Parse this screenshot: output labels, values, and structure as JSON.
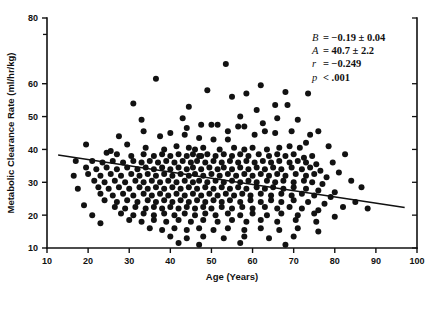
{
  "chart_data": {
    "type": "scatter",
    "title": "",
    "xlabel": "Age (Years)",
    "ylabel": "Metabolic Clearance Rate (ml/hr/kg)",
    "xlim": [
      10,
      100
    ],
    "ylim": [
      10,
      80
    ],
    "grid": false,
    "legend": null,
    "xticks": [
      10,
      20,
      30,
      40,
      50,
      60,
      70,
      80,
      90,
      100
    ],
    "xtick_labels": [
      "10",
      "20",
      "30",
      "40",
      "50",
      "60",
      "70",
      "80",
      "90",
      "100"
    ],
    "yticks": [
      10,
      20,
      30,
      40,
      50,
      60,
      80
    ],
    "ytick_labels": [
      "10",
      "20",
      "30",
      "40",
      "50",
      "60",
      "80"
    ],
    "yminor_ticks": [
      75
    ],
    "marker": "filled-circle",
    "marker_color": "#121212",
    "marker_size_px": 3.0,
    "annotations": [
      {
        "symbol": "B",
        "relation": "=",
        "value": "−0.19 ± 0.04"
      },
      {
        "symbol": "A",
        "relation": "=",
        "value": "40.7 ± 2.2"
      },
      {
        "symbol": "r",
        "relation": "=",
        "value": "−0.249"
      },
      {
        "symbol": "p",
        "relation": "<",
        "value": ".001"
      }
    ],
    "annotation_lines": [
      "B = −0.19 ± 0.04",
      "A = 40.7 ± 2.2",
      "r = −0.249",
      "p < .001"
    ],
    "regression": {
      "slope": -0.19,
      "intercept": 40.7,
      "r": -0.249,
      "p_text": "< .001",
      "x_start": 12.7,
      "y_start": 38.3,
      "x_end": 97.0,
      "y_end": 22.3,
      "color": "#111111"
    },
    "points": [
      [
        31.0,
        54.0
      ],
      [
        36.5,
        61.5
      ],
      [
        47.5,
        38.0
      ],
      [
        53.5,
        66.0
      ],
      [
        33.0,
        49.0
      ],
      [
        43.0,
        49.5
      ],
      [
        47.5,
        47.5
      ],
      [
        50.0,
        47.5
      ],
      [
        51.5,
        47.5
      ],
      [
        56.5,
        47.0
      ],
      [
        58.0,
        47.0
      ],
      [
        62.5,
        48.0
      ],
      [
        65.5,
        53.5
      ],
      [
        68.5,
        53.5
      ],
      [
        61.0,
        52.0
      ],
      [
        60.5,
        44.5
      ],
      [
        65.5,
        45.0
      ],
      [
        43.5,
        44.5
      ],
      [
        47.0,
        43.5
      ],
      [
        50.5,
        43.0
      ],
      [
        54.0,
        43.0
      ],
      [
        29.5,
        41.5
      ],
      [
        34.0,
        40.5
      ],
      [
        38.5,
        40.0
      ],
      [
        41.5,
        41.0
      ],
      [
        44.5,
        40.5
      ],
      [
        46.0,
        40.0
      ],
      [
        48.0,
        40.5
      ],
      [
        52.0,
        40.0
      ],
      [
        55.5,
        40.5
      ],
      [
        58.0,
        40.0
      ],
      [
        60.0,
        40.5
      ],
      [
        63.5,
        40.0
      ],
      [
        66.5,
        40.5
      ],
      [
        69.0,
        41.0
      ],
      [
        71.5,
        40.5
      ],
      [
        24.5,
        39.0
      ],
      [
        27.0,
        38.5
      ],
      [
        30.5,
        38.0
      ],
      [
        33.5,
        38.5
      ],
      [
        36.0,
        38.0
      ],
      [
        38.0,
        38.5
      ],
      [
        40.0,
        38.0
      ],
      [
        42.0,
        38.5
      ],
      [
        44.0,
        38.0
      ],
      [
        45.5,
        38.5
      ],
      [
        47.0,
        38.0
      ],
      [
        49.0,
        38.5
      ],
      [
        51.0,
        38.0
      ],
      [
        53.0,
        38.5
      ],
      [
        55.0,
        38.0
      ],
      [
        57.0,
        38.5
      ],
      [
        59.0,
        38.0
      ],
      [
        61.5,
        38.5
      ],
      [
        64.0,
        38.0
      ],
      [
        66.0,
        38.5
      ],
      [
        68.0,
        38.0
      ],
      [
        70.0,
        38.5
      ],
      [
        72.5,
        37.5
      ],
      [
        74.5,
        38.0
      ],
      [
        21.0,
        36.5
      ],
      [
        23.5,
        36.0
      ],
      [
        26.0,
        36.5
      ],
      [
        28.5,
        36.0
      ],
      [
        31.0,
        36.5
      ],
      [
        33.0,
        36.0
      ],
      [
        35.0,
        36.5
      ],
      [
        37.0,
        36.0
      ],
      [
        39.0,
        36.5
      ],
      [
        41.0,
        36.0
      ],
      [
        43.0,
        36.5
      ],
      [
        45.0,
        36.0
      ],
      [
        46.5,
        36.5
      ],
      [
        48.5,
        36.0
      ],
      [
        50.5,
        36.5
      ],
      [
        52.5,
        36.0
      ],
      [
        54.5,
        36.5
      ],
      [
        56.5,
        36.0
      ],
      [
        58.5,
        36.5
      ],
      [
        60.5,
        36.0
      ],
      [
        62.5,
        36.5
      ],
      [
        64.5,
        36.0
      ],
      [
        66.5,
        36.5
      ],
      [
        69.0,
        36.0
      ],
      [
        71.0,
        36.5
      ],
      [
        73.0,
        36.0
      ],
      [
        75.5,
        35.5
      ],
      [
        19.5,
        34.5
      ],
      [
        22.0,
        34.0
      ],
      [
        24.5,
        34.5
      ],
      [
        27.0,
        34.0
      ],
      [
        29.5,
        34.5
      ],
      [
        32.0,
        34.0
      ],
      [
        34.0,
        34.5
      ],
      [
        36.0,
        34.0
      ],
      [
        38.0,
        34.5
      ],
      [
        40.0,
        34.0
      ],
      [
        42.0,
        34.5
      ],
      [
        44.0,
        34.0
      ],
      [
        45.5,
        34.5
      ],
      [
        47.5,
        34.0
      ],
      [
        49.5,
        34.5
      ],
      [
        51.5,
        34.0
      ],
      [
        53.0,
        34.5
      ],
      [
        55.0,
        34.0
      ],
      [
        57.0,
        34.5
      ],
      [
        59.0,
        34.0
      ],
      [
        61.0,
        34.5
      ],
      [
        63.0,
        34.0
      ],
      [
        65.0,
        34.5
      ],
      [
        67.0,
        34.0
      ],
      [
        69.5,
        34.5
      ],
      [
        72.0,
        34.0
      ],
      [
        74.0,
        34.5
      ],
      [
        76.5,
        33.5
      ],
      [
        20.0,
        32.5
      ],
      [
        23.0,
        32.0
      ],
      [
        25.5,
        32.5
      ],
      [
        28.0,
        32.0
      ],
      [
        30.5,
        32.5
      ],
      [
        32.5,
        32.0
      ],
      [
        34.5,
        32.5
      ],
      [
        36.5,
        32.0
      ],
      [
        38.5,
        32.5
      ],
      [
        40.5,
        32.0
      ],
      [
        42.5,
        32.5
      ],
      [
        44.5,
        32.0
      ],
      [
        46.0,
        32.5
      ],
      [
        48.0,
        32.0
      ],
      [
        50.0,
        32.5
      ],
      [
        52.0,
        32.0
      ],
      [
        54.0,
        32.5
      ],
      [
        56.0,
        32.0
      ],
      [
        58.0,
        32.5
      ],
      [
        60.0,
        32.0
      ],
      [
        62.0,
        32.5
      ],
      [
        64.0,
        32.0
      ],
      [
        66.0,
        32.5
      ],
      [
        68.0,
        32.0
      ],
      [
        70.5,
        32.5
      ],
      [
        73.0,
        32.0
      ],
      [
        75.0,
        32.5
      ],
      [
        78.0,
        31.5
      ],
      [
        21.5,
        30.5
      ],
      [
        24.0,
        30.0
      ],
      [
        26.5,
        30.5
      ],
      [
        29.0,
        30.0
      ],
      [
        31.5,
        30.5
      ],
      [
        33.5,
        30.0
      ],
      [
        35.5,
        30.5
      ],
      [
        37.5,
        30.0
      ],
      [
        39.5,
        30.5
      ],
      [
        41.5,
        30.0
      ],
      [
        43.5,
        30.5
      ],
      [
        45.5,
        30.0
      ],
      [
        47.0,
        30.5
      ],
      [
        49.0,
        30.0
      ],
      [
        51.0,
        30.5
      ],
      [
        53.0,
        30.0
      ],
      [
        55.0,
        30.5
      ],
      [
        57.0,
        30.0
      ],
      [
        59.0,
        30.5
      ],
      [
        61.0,
        30.0
      ],
      [
        63.5,
        30.5
      ],
      [
        65.5,
        30.0
      ],
      [
        67.5,
        30.5
      ],
      [
        70.0,
        30.0
      ],
      [
        72.5,
        30.5
      ],
      [
        74.5,
        30.0
      ],
      [
        77.0,
        29.5
      ],
      [
        22.5,
        28.5
      ],
      [
        25.0,
        28.0
      ],
      [
        27.5,
        28.5
      ],
      [
        30.0,
        28.0
      ],
      [
        32.5,
        28.5
      ],
      [
        34.5,
        28.0
      ],
      [
        36.5,
        28.5
      ],
      [
        38.5,
        28.0
      ],
      [
        40.5,
        28.5
      ],
      [
        42.5,
        28.0
      ],
      [
        44.5,
        28.5
      ],
      [
        46.5,
        28.0
      ],
      [
        48.5,
        28.5
      ],
      [
        50.5,
        28.0
      ],
      [
        52.5,
        28.5
      ],
      [
        54.5,
        28.0
      ],
      [
        56.5,
        28.5
      ],
      [
        58.5,
        28.0
      ],
      [
        61.0,
        28.5
      ],
      [
        63.0,
        28.0
      ],
      [
        65.0,
        28.5
      ],
      [
        67.5,
        28.0
      ],
      [
        70.0,
        28.5
      ],
      [
        73.0,
        28.0
      ],
      [
        76.0,
        27.5
      ],
      [
        80.0,
        27.0
      ],
      [
        23.0,
        26.5
      ],
      [
        26.0,
        26.0
      ],
      [
        28.5,
        26.5
      ],
      [
        31.0,
        26.0
      ],
      [
        33.5,
        26.5
      ],
      [
        35.5,
        26.0
      ],
      [
        37.5,
        26.5
      ],
      [
        39.5,
        26.0
      ],
      [
        41.5,
        26.5
      ],
      [
        43.5,
        26.0
      ],
      [
        45.5,
        26.5
      ],
      [
        47.5,
        26.0
      ],
      [
        49.5,
        26.5
      ],
      [
        51.5,
        26.0
      ],
      [
        53.5,
        26.5
      ],
      [
        55.5,
        26.0
      ],
      [
        57.5,
        26.5
      ],
      [
        59.5,
        26.0
      ],
      [
        62.0,
        26.5
      ],
      [
        64.5,
        26.0
      ],
      [
        67.0,
        26.5
      ],
      [
        69.5,
        26.0
      ],
      [
        72.0,
        26.5
      ],
      [
        75.0,
        26.0
      ],
      [
        79.0,
        25.5
      ],
      [
        24.0,
        24.5
      ],
      [
        27.0,
        24.0
      ],
      [
        29.5,
        24.5
      ],
      [
        32.0,
        24.0
      ],
      [
        34.5,
        24.5
      ],
      [
        36.5,
        24.0
      ],
      [
        38.5,
        24.5
      ],
      [
        40.5,
        24.0
      ],
      [
        42.5,
        24.5
      ],
      [
        44.5,
        24.0
      ],
      [
        46.5,
        24.5
      ],
      [
        48.5,
        24.0
      ],
      [
        50.5,
        24.5
      ],
      [
        52.5,
        24.0
      ],
      [
        54.5,
        24.5
      ],
      [
        57.0,
        24.0
      ],
      [
        59.5,
        24.5
      ],
      [
        62.0,
        24.0
      ],
      [
        64.5,
        24.5
      ],
      [
        67.0,
        24.0
      ],
      [
        70.0,
        24.5
      ],
      [
        73.5,
        24.0
      ],
      [
        77.5,
        23.5
      ],
      [
        26.5,
        22.5
      ],
      [
        29.0,
        22.0
      ],
      [
        31.5,
        22.5
      ],
      [
        34.0,
        22.0
      ],
      [
        36.0,
        22.5
      ],
      [
        38.0,
        22.0
      ],
      [
        40.0,
        22.5
      ],
      [
        42.0,
        22.0
      ],
      [
        44.0,
        22.5
      ],
      [
        46.0,
        22.0
      ],
      [
        48.0,
        22.5
      ],
      [
        50.0,
        22.0
      ],
      [
        52.5,
        22.5
      ],
      [
        55.0,
        22.0
      ],
      [
        57.5,
        22.5
      ],
      [
        60.0,
        22.0
      ],
      [
        63.0,
        22.5
      ],
      [
        66.0,
        22.0
      ],
      [
        69.0,
        22.5
      ],
      [
        72.0,
        22.0
      ],
      [
        76.0,
        21.5
      ],
      [
        82.0,
        22.5
      ],
      [
        28.0,
        20.5
      ],
      [
        31.0,
        20.0
      ],
      [
        33.5,
        20.5
      ],
      [
        36.0,
        20.0
      ],
      [
        38.5,
        20.5
      ],
      [
        41.0,
        20.0
      ],
      [
        43.5,
        20.5
      ],
      [
        46.0,
        20.0
      ],
      [
        48.5,
        20.5
      ],
      [
        51.0,
        20.0
      ],
      [
        54.0,
        20.5
      ],
      [
        57.0,
        20.0
      ],
      [
        60.0,
        20.5
      ],
      [
        63.5,
        20.0
      ],
      [
        67.0,
        20.5
      ],
      [
        71.0,
        20.0
      ],
      [
        75.0,
        20.5
      ],
      [
        80.0,
        19.5
      ],
      [
        30.0,
        18.5
      ],
      [
        33.0,
        18.0
      ],
      [
        36.0,
        18.5
      ],
      [
        39.0,
        18.0
      ],
      [
        42.0,
        18.5
      ],
      [
        45.0,
        18.0
      ],
      [
        48.0,
        18.5
      ],
      [
        51.5,
        18.0
      ],
      [
        55.0,
        18.5
      ],
      [
        58.5,
        18.0
      ],
      [
        62.0,
        18.5
      ],
      [
        66.0,
        18.0
      ],
      [
        70.5,
        18.5
      ],
      [
        75.5,
        18.0
      ],
      [
        19.0,
        23.0
      ],
      [
        17.5,
        28.0
      ],
      [
        16.5,
        32.0
      ],
      [
        21.0,
        20.0
      ],
      [
        23.0,
        17.5
      ],
      [
        35.0,
        16.0
      ],
      [
        38.0,
        15.5
      ],
      [
        41.0,
        16.0
      ],
      [
        44.0,
        15.5
      ],
      [
        47.0,
        16.0
      ],
      [
        50.5,
        15.5
      ],
      [
        54.0,
        16.0
      ],
      [
        58.0,
        15.5
      ],
      [
        62.0,
        16.0
      ],
      [
        66.5,
        15.5
      ],
      [
        71.0,
        16.0
      ],
      [
        76.0,
        15.0
      ],
      [
        40.0,
        13.5
      ],
      [
        44.0,
        13.0
      ],
      [
        48.0,
        13.5
      ],
      [
        53.0,
        13.0
      ],
      [
        58.0,
        13.5
      ],
      [
        64.0,
        13.0
      ],
      [
        70.0,
        13.5
      ],
      [
        42.0,
        11.5
      ],
      [
        47.0,
        11.0
      ],
      [
        57.0,
        11.5
      ],
      [
        68.0,
        11.0
      ],
      [
        85.0,
        24.0
      ],
      [
        88.0,
        22.0
      ],
      [
        86.5,
        28.5
      ],
      [
        84.0,
        30.5
      ],
      [
        81.0,
        33.0
      ],
      [
        79.5,
        36.0
      ],
      [
        82.5,
        38.5
      ],
      [
        78.5,
        41.0
      ],
      [
        74.0,
        44.5
      ],
      [
        71.0,
        49.0
      ],
      [
        76.0,
        45.5
      ],
      [
        73.0,
        42.0
      ],
      [
        69.5,
        45.5
      ],
      [
        66.0,
        49.5
      ],
      [
        63.0,
        45.5
      ],
      [
        57.0,
        50.0
      ],
      [
        54.0,
        45.5
      ],
      [
        44.0,
        46.5
      ],
      [
        40.0,
        45.0
      ],
      [
        37.5,
        44.0
      ],
      [
        55.0,
        56.0
      ],
      [
        58.5,
        57.0
      ],
      [
        68.0,
        57.5
      ],
      [
        73.5,
        57.0
      ],
      [
        62.0,
        59.5
      ],
      [
        49.0,
        58.0
      ],
      [
        44.5,
        53.0
      ],
      [
        33.5,
        45.5
      ],
      [
        27.5,
        44.0
      ],
      [
        25.5,
        39.5
      ],
      [
        17.0,
        36.5
      ],
      [
        19.5,
        41.5
      ]
    ]
  }
}
